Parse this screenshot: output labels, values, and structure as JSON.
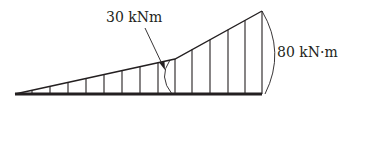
{
  "diagram": {
    "title": "",
    "type": "bending-moment-diagram",
    "labels": {
      "kink_moment": "30 kNm",
      "end_moment": "80 kN·m"
    },
    "values": {
      "kink_moment_kNm": 30,
      "end_moment_kNm": 80
    },
    "colors": {
      "line": "#231f20",
      "background": "#ffffff"
    }
  }
}
